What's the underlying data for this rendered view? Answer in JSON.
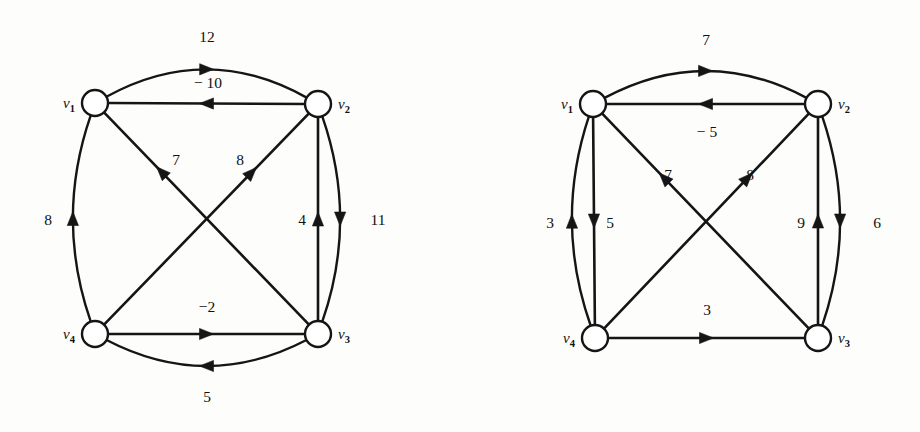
{
  "figure": {
    "background": "#fdfdfc",
    "ink_color": "#151515",
    "node_fill": "#ffffff",
    "width": 920,
    "height": 432
  },
  "graphs": [
    {
      "id": "left-graph",
      "name": "weighted-digraph-left",
      "origin_x": 0,
      "nodes": [
        {
          "id": "v1",
          "label": "v",
          "sub": "1",
          "cx": 95,
          "cy": 103,
          "r": 13,
          "label_side": "left"
        },
        {
          "id": "v2",
          "label": "v",
          "sub": "2",
          "cx": 318,
          "cy": 104,
          "r": 13,
          "label_side": "right"
        },
        {
          "id": "v3",
          "label": "v",
          "sub": "3",
          "cx": 318,
          "cy": 334,
          "r": 13,
          "label_side": "right"
        },
        {
          "id": "v4",
          "label": "v",
          "sub": "4",
          "cx": 95,
          "cy": 334,
          "r": 13,
          "label_side": "left"
        }
      ],
      "edges": [
        {
          "id": "e-v1-v2-arc",
          "from": "v1",
          "to": "v2",
          "weight": "12",
          "shape": "arc",
          "bulge": -62,
          "label_x": 207,
          "label_y": 42,
          "arrow_t": 0.5
        },
        {
          "id": "e-v2-v1",
          "from": "v2",
          "to": "v1",
          "weight": "− 10",
          "shape": "line",
          "bulge": 0,
          "label_x": 208,
          "label_y": 88,
          "arrow_t": 0.5
        },
        {
          "id": "e-v4-v1-arc",
          "from": "v4",
          "to": "v1",
          "weight": "8",
          "shape": "arc",
          "bulge": -40,
          "label_x": 48,
          "label_y": 225,
          "arrow_t": 0.5
        },
        {
          "id": "e-v2-v3-arc",
          "from": "v2",
          "to": "v3",
          "weight": "11",
          "shape": "arc",
          "bulge": -40,
          "label_x": 378,
          "label_y": 225,
          "arrow_t": 0.5
        },
        {
          "id": "e-v3-v2",
          "from": "v3",
          "to": "v2",
          "weight": "4",
          "shape": "line",
          "bulge": 0,
          "label_x": 302,
          "label_y": 225,
          "arrow_t": 0.5
        },
        {
          "id": "e-v3-v1",
          "from": "v3",
          "to": "v1",
          "weight": "7",
          "shape": "line",
          "bulge": 0,
          "label_x": 176,
          "label_y": 165,
          "arrow_t": 0.72
        },
        {
          "id": "e-v4-v2",
          "from": "v4",
          "to": "v2",
          "weight": "8",
          "shape": "line",
          "bulge": 0,
          "label_x": 240,
          "label_y": 165,
          "arrow_t": 0.72
        },
        {
          "id": "e-v4-v3",
          "from": "v4",
          "to": "v3",
          "weight": "−2",
          "shape": "line",
          "bulge": 0,
          "label_x": 207,
          "label_y": 312,
          "arrow_t": 0.5
        },
        {
          "id": "e-v3-v4-arc",
          "from": "v3",
          "to": "v4",
          "weight": "5",
          "shape": "arc",
          "bulge": -58,
          "label_x": 207,
          "label_y": 402,
          "arrow_t": 0.5
        }
      ]
    },
    {
      "id": "right-graph",
      "name": "weighted-digraph-right",
      "origin_x": 500,
      "nodes": [
        {
          "id": "v1",
          "label": "v",
          "sub": "1",
          "cx": 93,
          "cy": 104,
          "r": 13,
          "label_side": "left"
        },
        {
          "id": "v2",
          "label": "v",
          "sub": "2",
          "cx": 318,
          "cy": 104,
          "r": 13,
          "label_side": "right"
        },
        {
          "id": "v3",
          "label": "v",
          "sub": "3",
          "cx": 318,
          "cy": 338,
          "r": 13,
          "label_side": "right"
        },
        {
          "id": "v4",
          "label": "v",
          "sub": "4",
          "cx": 95,
          "cy": 338,
          "r": 13,
          "label_side": "left"
        }
      ],
      "edges": [
        {
          "id": "e-v1-v2-arc",
          "from": "v1",
          "to": "v2",
          "weight": "7",
          "shape": "arc",
          "bulge": -60,
          "label_x": 206,
          "label_y": 45,
          "arrow_t": 0.5
        },
        {
          "id": "e-v2-v1",
          "from": "v2",
          "to": "v1",
          "weight": "− 5",
          "shape": "line",
          "bulge": 0,
          "label_x": 207,
          "label_y": 137,
          "arrow_t": 0.5
        },
        {
          "id": "e-v4-v1-arc",
          "from": "v4",
          "to": "v1",
          "weight": "3",
          "shape": "arc",
          "bulge": -40,
          "label_x": 50,
          "label_y": 228,
          "arrow_t": 0.5
        },
        {
          "id": "e-v1-v4",
          "from": "v1",
          "to": "v4",
          "weight": "5",
          "shape": "line",
          "bulge": 0,
          "label_x": 110,
          "label_y": 228,
          "arrow_t": 0.5
        },
        {
          "id": "e-v2-v3-arc",
          "from": "v2",
          "to": "v3",
          "weight": "6",
          "shape": "arc",
          "bulge": -40,
          "label_x": 377,
          "label_y": 228,
          "arrow_t": 0.5
        },
        {
          "id": "e-v3-v2",
          "from": "v3",
          "to": "v2",
          "weight": "9",
          "shape": "line",
          "bulge": 0,
          "label_x": 301,
          "label_y": 228,
          "arrow_t": 0.5
        },
        {
          "id": "e-v3-v1",
          "from": "v3",
          "to": "v1",
          "weight": "7",
          "shape": "line",
          "bulge": 0,
          "label_x": 168,
          "label_y": 180,
          "arrow_t": 0.7
        },
        {
          "id": "e-v4-v2",
          "from": "v4",
          "to": "v2",
          "weight": "8",
          "shape": "line",
          "bulge": 0,
          "label_x": 250,
          "label_y": 180,
          "arrow_t": 0.7
        },
        {
          "id": "e-v4-v3",
          "from": "v4",
          "to": "v3",
          "weight": "3",
          "shape": "line",
          "bulge": 0,
          "label_x": 207,
          "label_y": 315,
          "arrow_t": 0.5
        }
      ]
    }
  ]
}
